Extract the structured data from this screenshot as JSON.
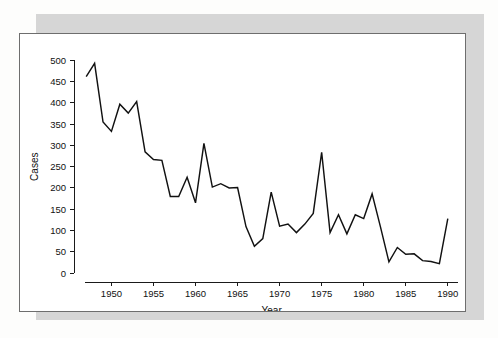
{
  "figure": {
    "background_color": "#ffffff",
    "border_color": "#6e6e6e",
    "shadow_color": "#d6d6d6",
    "line_color": "#111111"
  },
  "chart_data": {
    "type": "line",
    "title": "",
    "xlabel": "Year",
    "ylabel": "Cases",
    "xlim": [
      1946.5,
      1990.5
    ],
    "ylim": [
      0,
      515
    ],
    "xticks": [
      1950,
      1955,
      1960,
      1965,
      1970,
      1975,
      1980,
      1985,
      1990
    ],
    "xtick_labels": [
      "1950",
      "1955",
      "1960",
      "1965",
      "1970",
      "1975",
      "1980",
      "1985",
      "1990"
    ],
    "yticks": [
      0,
      50,
      100,
      150,
      200,
      250,
      300,
      350,
      400,
      450,
      500
    ],
    "ytick_labels": [
      "0",
      "50",
      "100",
      "150",
      "200",
      "250",
      "300",
      "350",
      "400",
      "450",
      "500"
    ],
    "grid": false,
    "legend": false,
    "series": [
      {
        "name": "Cases",
        "color": "#111111",
        "x": [
          1947,
          1948,
          1949,
          1950,
          1951,
          1952,
          1953,
          1954,
          1955,
          1956,
          1957,
          1958,
          1959,
          1960,
          1961,
          1962,
          1963,
          1964,
          1965,
          1966,
          1967,
          1968,
          1969,
          1970,
          1971,
          1972,
          1973,
          1974,
          1975,
          1976,
          1977,
          1978,
          1979,
          1980,
          1981,
          1982,
          1983,
          1984,
          1985,
          1986,
          1987,
          1988,
          1989,
          1990
        ],
        "values": [
          462,
          493,
          355,
          333,
          397,
          376,
          403,
          285,
          267,
          265,
          180,
          180,
          225,
          165,
          305,
          202,
          210,
          200,
          201,
          109,
          63,
          81,
          190,
          110,
          115,
          95,
          115,
          140,
          284,
          95,
          137,
          92,
          137,
          128,
          186,
          108,
          26,
          60,
          44,
          45,
          29,
          27,
          22,
          128
        ]
      }
    ]
  }
}
